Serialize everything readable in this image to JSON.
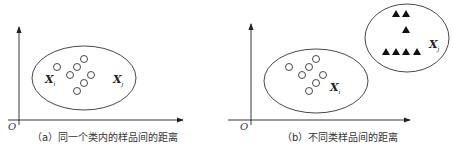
{
  "figure": {
    "panels": [
      {
        "id": "a",
        "caption": "（a）同一个类内的样品间的距离",
        "origin_label": "O",
        "labels": [
          {
            "main": "X",
            "sub": "i"
          },
          {
            "main": "X",
            "sub": "j"
          }
        ],
        "cluster": {
          "shape": "circle",
          "count": 8
        }
      },
      {
        "id": "b",
        "caption": "（b）不同类样品间的距离",
        "origin_label": "O",
        "labels": [
          {
            "main": "X",
            "sub": "i"
          },
          {
            "main": "X",
            "sub": "j"
          }
        ],
        "clusters": [
          {
            "shape": "circle",
            "count": 8,
            "label_index": 0
          },
          {
            "shape": "triangle",
            "count": 7,
            "label_index": 1
          }
        ]
      }
    ]
  }
}
